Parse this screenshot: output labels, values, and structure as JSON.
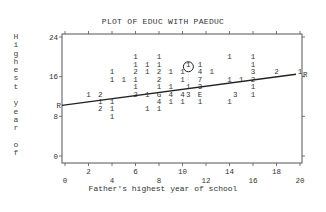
{
  "chart_data": {
    "type": "scatter",
    "title": "PLOT OF EDUC WITH PAEDUC",
    "xlabel": "Father's highest year of school",
    "ylabel": "Highest year of",
    "xlim": [
      0,
      20
    ],
    "ylim": [
      0,
      24
    ],
    "x_ticks_lower": [
      "0",
      "4",
      "8",
      "12",
      "16",
      "20"
    ],
    "x_ticks_upper": [
      "2",
      "6",
      "10",
      "14",
      "18"
    ],
    "y_ticks": [
      "0",
      "8",
      "16",
      "24"
    ],
    "grid": false,
    "legend": null,
    "plot_style": "character-density plot (digits = count of cases at position; letters mark larger counts, R = regression line endpoint)",
    "regression_line": {
      "x_start": 0,
      "y_start": 10.2,
      "x_end": 20,
      "y_end": 16.5,
      "end_markers": [
        "R",
        "R"
      ]
    },
    "highlighted_point": {
      "x": 10.5,
      "y": 18,
      "marker": "1",
      "note": "circled"
    },
    "points": [
      {
        "x": 6,
        "y": 20,
        "label": "1"
      },
      {
        "x": 8,
        "y": 20,
        "label": "1"
      },
      {
        "x": 14,
        "y": 20,
        "label": "1"
      },
      {
        "x": 16,
        "y": 20,
        "label": "1"
      },
      {
        "x": 6,
        "y": 18.5,
        "label": "1"
      },
      {
        "x": 7,
        "y": 18.5,
        "label": "1"
      },
      {
        "x": 8,
        "y": 18.5,
        "label": "1"
      },
      {
        "x": 10.5,
        "y": 18.5,
        "label": "1"
      },
      {
        "x": 11.5,
        "y": 18.5,
        "label": "1"
      },
      {
        "x": 16,
        "y": 18.5,
        "label": "1"
      },
      {
        "x": 4,
        "y": 17,
        "label": "1"
      },
      {
        "x": 6,
        "y": 17,
        "label": "2"
      },
      {
        "x": 7,
        "y": 17,
        "label": "1"
      },
      {
        "x": 8,
        "y": 17,
        "label": "2"
      },
      {
        "x": 9,
        "y": 17,
        "label": "1"
      },
      {
        "x": 10,
        "y": 17,
        "label": "1"
      },
      {
        "x": 11.5,
        "y": 17,
        "label": "4"
      },
      {
        "x": 12.5,
        "y": 17,
        "label": "1"
      },
      {
        "x": 16,
        "y": 17,
        "label": "3"
      },
      {
        "x": 18,
        "y": 17,
        "label": "2"
      },
      {
        "x": 20,
        "y": 17,
        "label": "1"
      },
      {
        "x": 4,
        "y": 15.5,
        "label": "1"
      },
      {
        "x": 5,
        "y": 15.5,
        "label": "1"
      },
      {
        "x": 6,
        "y": 15.5,
        "label": "1"
      },
      {
        "x": 8,
        "y": 15.5,
        "label": "2"
      },
      {
        "x": 10,
        "y": 15.5,
        "label": "1"
      },
      {
        "x": 11.5,
        "y": 15.5,
        "label": "7"
      },
      {
        "x": 14,
        "y": 15.5,
        "label": "1"
      },
      {
        "x": 15,
        "y": 15.5,
        "label": "1"
      },
      {
        "x": 16,
        "y": 15.5,
        "label": "2"
      },
      {
        "x": 6,
        "y": 14,
        "label": "1"
      },
      {
        "x": 8,
        "y": 14,
        "label": "1"
      },
      {
        "x": 9,
        "y": 14,
        "label": "1"
      },
      {
        "x": 10.5,
        "y": 14,
        "label": "1"
      },
      {
        "x": 11.5,
        "y": 14,
        "label": "3"
      },
      {
        "x": 16,
        "y": 14,
        "label": "1"
      },
      {
        "x": 2,
        "y": 12.5,
        "label": "1"
      },
      {
        "x": 3,
        "y": 12.5,
        "label": "2"
      },
      {
        "x": 6,
        "y": 12.5,
        "label": "2"
      },
      {
        "x": 7,
        "y": 12.5,
        "label": "1"
      },
      {
        "x": 8,
        "y": 12.5,
        "label": "G"
      },
      {
        "x": 9,
        "y": 12.5,
        "label": "4"
      },
      {
        "x": 10,
        "y": 12.5,
        "label": "4"
      },
      {
        "x": 10.5,
        "y": 12.5,
        "label": "3"
      },
      {
        "x": 11.5,
        "y": 12.5,
        "label": "E"
      },
      {
        "x": 14.5,
        "y": 12.5,
        "label": "3"
      },
      {
        "x": 16,
        "y": 12.5,
        "label": "1"
      },
      {
        "x": 3,
        "y": 11,
        "label": "1"
      },
      {
        "x": 4,
        "y": 11,
        "label": "1"
      },
      {
        "x": 8,
        "y": 11,
        "label": "4"
      },
      {
        "x": 9,
        "y": 11,
        "label": "1"
      },
      {
        "x": 10,
        "y": 11,
        "label": "1"
      },
      {
        "x": 11.5,
        "y": 11,
        "label": "1"
      },
      {
        "x": 14,
        "y": 11,
        "label": "1"
      },
      {
        "x": 3,
        "y": 9.5,
        "label": "2"
      },
      {
        "x": 4,
        "y": 9.5,
        "label": "1"
      },
      {
        "x": 7,
        "y": 9.5,
        "label": "1"
      },
      {
        "x": 8,
        "y": 9.5,
        "label": "1"
      },
      {
        "x": 4,
        "y": 8,
        "label": "1"
      }
    ]
  },
  "plot": {
    "title": "PLOT OF EDUC WITH PAEDUC",
    "xlabel": "Father's highest year of school",
    "ylabel_chars": "H\ni\ng\nh\ne\ns\nt\n\ny\ne\na\nr\n\no\nf",
    "colors": {
      "axis": "#555555",
      "text": "#333333",
      "line": "#222222",
      "background": "#ffffff"
    }
  }
}
